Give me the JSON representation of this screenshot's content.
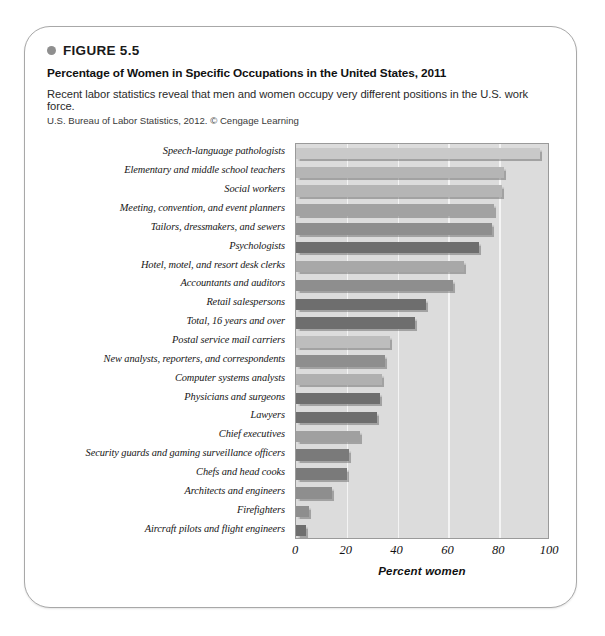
{
  "figure": {
    "number": "FIGURE 5.5",
    "title": "Percentage of Women in Specific Occupations in the United States, 2011",
    "description": "Recent labor statistics reveal that men and women occupy very different positions in the U.S. work force.",
    "source": "U.S. Bureau of Labor Statistics, 2012. © Cengage Learning"
  },
  "chart_data": {
    "type": "bar",
    "orientation": "horizontal",
    "title": "Percentage of Women in Specific Occupations in the United States, 2011",
    "xlabel": "Percent women",
    "ylabel": "",
    "xlim": [
      0,
      100
    ],
    "xticks": [
      0,
      20,
      40,
      60,
      80,
      100
    ],
    "grid": true,
    "legend": "none",
    "categories": [
      "Speech-language pathologists",
      "Elementary and middle school teachers",
      "Social workers",
      "Meeting, convention, and event planners",
      "Tailors, dressmakers, and sewers",
      "Psychologists",
      "Hotel, motel, and resort desk clerks",
      "Accountants and auditors",
      "Retail salespersons",
      "Total, 16 years and over",
      "Postal service mail carriers",
      "New analysts, reporters, and correspondents",
      "Computer systems analysts",
      "Physicians and surgeons",
      "Lawyers",
      "Chief executives",
      "Security guards and gaming surveillance officers",
      "Chefs and head cooks",
      "Architects and engineers",
      "Firefighters",
      "Aircraft pilots and flight engineers"
    ],
    "values": [
      96,
      82,
      81,
      78,
      77,
      72,
      66,
      62,
      51,
      47,
      37,
      35,
      34,
      33,
      32,
      25,
      21,
      20,
      14,
      5,
      4
    ],
    "bar_colors": [
      "#c9c9c9",
      "#b5b5b5",
      "#b5b5b5",
      "#a2a2a2",
      "#8e8e8e",
      "#6e6e6e",
      "#a8a8a8",
      "#8e8e8e",
      "#6e6e6e",
      "#6e6e6e",
      "#bdbdbd",
      "#8e8e8e",
      "#b0b0b0",
      "#6e6e6e",
      "#6e6e6e",
      "#a0a0a0",
      "#7a7a7a",
      "#7a7a7a",
      "#8e8e8e",
      "#8e8e8e",
      "#6e6e6e"
    ],
    "plot_background": "#dcdcdc",
    "gridline_color": "#f4f4f4"
  }
}
